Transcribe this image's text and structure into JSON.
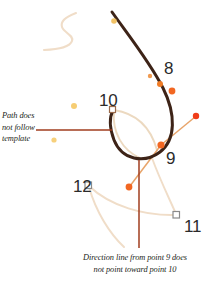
{
  "figure": {
    "background_color": "#ffffff"
  },
  "colors": {
    "path_stroke": "#3d2317",
    "template_stroke": "#f0ddc8",
    "template_stroke_strong": "#ecd9c0",
    "handle_line": "#e8a46a",
    "handle_dot": "#f26722",
    "anchor_dot": "#f07c26",
    "anchor_square_fill": "#ffffff",
    "anchor_square_stroke": "#8a8a8a",
    "leader_line": "#a03c1e",
    "callout_text": "#231f20",
    "label_text": "#2b2b2b",
    "stray_dot": "#f5c45a"
  },
  "annotations": [
    {
      "name": "path-does-not-follow-template",
      "lines": [
        "Path does",
        "not follow",
        "template"
      ],
      "text": "Path does not follow template",
      "position": "left",
      "leader": "horizontal"
    },
    {
      "name": "direction-line-callout",
      "lines": [
        "Direction line from point 9 does",
        "not point toward point 10"
      ],
      "text": "Direction line from point 9 does not point toward point 10",
      "position": "bottom",
      "leader": "vertical"
    }
  ],
  "point_labels": [
    {
      "id": "8",
      "text": "8",
      "x": 164,
      "y": 60
    },
    {
      "id": "9",
      "text": "9",
      "x": 166,
      "y": 150
    },
    {
      "id": "10",
      "text": "10",
      "x": 99,
      "y": 92
    },
    {
      "id": "11",
      "text": "11",
      "x": 184,
      "y": 218
    },
    {
      "id": "12",
      "text": "12",
      "x": 73,
      "y": 178
    }
  ],
  "anchors": [
    {
      "id": "8",
      "type": "round-filled",
      "x": 160,
      "y": 83
    },
    {
      "id": "8b",
      "type": "round-filled",
      "x": 173,
      "y": 90
    },
    {
      "id": "8c",
      "type": "round-small",
      "x": 150,
      "y": 76
    },
    {
      "id": "9",
      "type": "round-filled",
      "x": 161,
      "y": 145
    },
    {
      "id": "10",
      "type": "square-hollow",
      "x": 113,
      "y": 110
    },
    {
      "id": "11",
      "type": "square-hollow",
      "x": 176,
      "y": 215
    },
    {
      "id": "12",
      "type": "square-hollow",
      "x": 88,
      "y": 185
    },
    {
      "id": "top",
      "type": "round-small",
      "x": 114,
      "y": 21
    }
  ],
  "handles": [
    {
      "from": "9",
      "to_x": 196,
      "to_y": 117,
      "dot": true
    },
    {
      "from": "9",
      "to_x": 129,
      "to_y": 186,
      "dot": true
    }
  ],
  "stray_dots": [
    {
      "x": 74,
      "y": 106
    },
    {
      "x": 54,
      "y": 140
    }
  ]
}
